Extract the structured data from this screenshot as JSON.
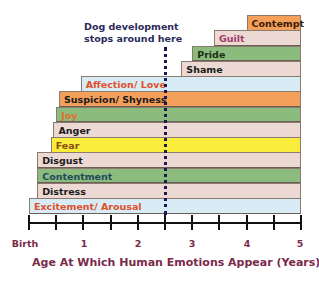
{
  "chart_data": {
    "type": "bar",
    "orientation": "horizontal",
    "title": "",
    "xlabel": "Age At Which Human Emotions Appear (Years)",
    "ylabel": "",
    "xlim": [
      0,
      5
    ],
    "x_tick_labels": [
      {
        "value": 0,
        "label": "Birth"
      },
      {
        "value": 1,
        "label": "1"
      },
      {
        "value": 2,
        "label": "2"
      },
      {
        "value": 3,
        "label": "3"
      },
      {
        "value": 4,
        "label": "4"
      },
      {
        "value": 5,
        "label": "5"
      }
    ],
    "minor_ticks_every": 0.5,
    "annotations": [
      {
        "text_line1": "Dog development",
        "text_line2": "stops around here",
        "x": 2.5,
        "style": "dotted vertical line"
      }
    ],
    "categories": [
      "Contempt",
      "Guilt",
      "Pride",
      "Shame",
      "Affection/ Love",
      "Suspicion/ Shyness",
      "Joy",
      "Anger",
      "Fear",
      "Disgust",
      "Contentment",
      "Distress",
      "Excitement/ Arousal"
    ],
    "series": [
      {
        "name": "Age of emergence (years)",
        "values": [
          4.0,
          3.4,
          3.0,
          2.8,
          0.95,
          0.55,
          0.5,
          0.45,
          0.4,
          0.15,
          0.15,
          0.15,
          0.0
        ]
      }
    ],
    "bar_end": 5,
    "grid": false,
    "legend": "none"
  },
  "bars": [
    {
      "label": "Contempt",
      "start": 4.0,
      "fill": "#f5a05a",
      "text": "#3a1a0a"
    },
    {
      "label": "Guilt",
      "start": 3.4,
      "fill": "#ecd9d4",
      "text": "#a03a6a"
    },
    {
      "label": "Pride",
      "start": 3.0,
      "fill": "#8cbb7e",
      "text": "#1a2e14"
    },
    {
      "label": "Shame",
      "start": 2.8,
      "fill": "#ecd9d4",
      "text": "#1a1a1a"
    },
    {
      "label": "Affection/ Love",
      "start": 0.95,
      "fill": "#d8ecf5",
      "text": "#e0502a"
    },
    {
      "label": "Suspicion/ Shyness",
      "start": 0.55,
      "fill": "#f5a05a",
      "text": "#1a1a1a"
    },
    {
      "label": "Joy",
      "start": 0.5,
      "fill": "#8cbb7e",
      "text": "#e0702a"
    },
    {
      "label": "Anger",
      "start": 0.45,
      "fill": "#ecd9d4",
      "text": "#1a1a1a"
    },
    {
      "label": "Fear",
      "start": 0.4,
      "fill": "#f9ec3a",
      "text": "#8a4a14"
    },
    {
      "label": "Disgust",
      "start": 0.15,
      "fill": "#ecd9d4",
      "text": "#1a1a1a"
    },
    {
      "label": "Contentment",
      "start": 0.15,
      "fill": "#8cbb7e",
      "text": "#1f4a5a"
    },
    {
      "label": "Distress",
      "start": 0.15,
      "fill": "#ecd9d4",
      "text": "#1a1a1a"
    },
    {
      "label": "Excitement/ Arousal",
      "start": 0.0,
      "fill": "#d8ecf5",
      "text": "#e0502a"
    }
  ],
  "annotation": {
    "line1": "Dog development",
    "line2": "stops around here"
  },
  "axis": {
    "labels": [
      "Birth",
      "1",
      "2",
      "3",
      "4",
      "5"
    ],
    "title": "Age At Which Human Emotions Appear (Years)"
  },
  "colors": {
    "axis": "#111111",
    "axis_text": "#7a2a4a",
    "annotation_text": "#2a2a5a",
    "dotted_line": "#1a1a50"
  }
}
